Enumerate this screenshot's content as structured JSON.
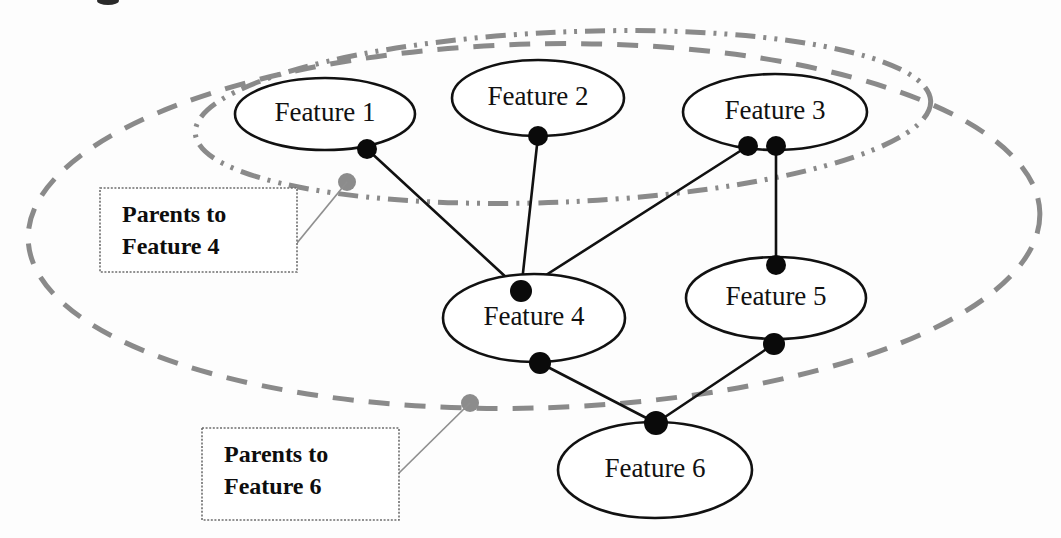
{
  "diagram": {
    "type": "node-link-graph",
    "background_color": "#fdfdfd",
    "colors": {
      "node_stroke": "#111111",
      "node_fill": "#ffffff",
      "edge": "#111111",
      "dot": "#0a0a0a",
      "dot_marker_gray": "#8c8c8c",
      "group_boundary": "#8a8a8a",
      "leader_line": "#8f8f8f",
      "callout_border": "#6e6e6e",
      "text": "#111111"
    }
  },
  "nodes": [
    {
      "id": "f1",
      "label": "Feature 1",
      "cx": 325,
      "cy": 114,
      "rx": 90,
      "ry": 36
    },
    {
      "id": "f2",
      "label": "Feature 2",
      "cx": 538,
      "cy": 98,
      "rx": 86,
      "ry": 38
    },
    {
      "id": "f3",
      "label": "Feature 3",
      "cx": 775,
      "cy": 112,
      "rx": 92,
      "ry": 38
    },
    {
      "id": "f4",
      "label": "Feature 4",
      "cx": 534,
      "cy": 318,
      "rx": 91,
      "ry": 44
    },
    {
      "id": "f5",
      "label": "Feature 5",
      "cx": 776,
      "cy": 298,
      "rx": 90,
      "ry": 41
    },
    {
      "id": "f6",
      "label": "Feature 6",
      "cx": 655,
      "cy": 470,
      "rx": 97,
      "ry": 48
    }
  ],
  "dots": [
    {
      "id": "d-f1-out",
      "on": "f1",
      "x": 367,
      "y": 149,
      "r": 10,
      "kind": "black"
    },
    {
      "id": "d-f2-out",
      "on": "f2",
      "x": 538,
      "y": 136,
      "r": 10,
      "kind": "black"
    },
    {
      "id": "d-f3-out-a",
      "on": "f3",
      "x": 748,
      "y": 146,
      "r": 10,
      "kind": "black"
    },
    {
      "id": "d-f3-out-b",
      "on": "f3",
      "x": 776,
      "y": 146,
      "r": 10,
      "kind": "black"
    },
    {
      "id": "d-f4-in",
      "on": "f4",
      "x": 521,
      "y": 291,
      "r": 11,
      "kind": "black"
    },
    {
      "id": "d-f4-out",
      "on": "f4",
      "x": 540,
      "y": 363,
      "r": 11,
      "kind": "black"
    },
    {
      "id": "d-f5-in",
      "on": "f5",
      "x": 776,
      "y": 265,
      "r": 10,
      "kind": "black"
    },
    {
      "id": "d-f5-out",
      "on": "f5",
      "x": 774,
      "y": 344,
      "r": 11,
      "kind": "black"
    },
    {
      "id": "d-f6-in",
      "on": "f6",
      "x": 656,
      "y": 423,
      "r": 12,
      "kind": "black"
    },
    {
      "id": "d-marker-parents4",
      "on": "group-parents-to-feature-4",
      "x": 347,
      "y": 182,
      "r": 9,
      "kind": "gray"
    },
    {
      "id": "d-marker-parents6",
      "on": "group-parents-to-feature-6",
      "x": 470,
      "y": 403,
      "r": 9,
      "kind": "gray"
    }
  ],
  "edges": [
    {
      "id": "e1",
      "from": "f1",
      "to": "f4",
      "x1": 367,
      "y1": 149,
      "x2": 521,
      "y2": 291
    },
    {
      "id": "e2",
      "from": "f2",
      "to": "f4",
      "x1": 538,
      "y1": 136,
      "x2": 521,
      "y2": 291
    },
    {
      "id": "e3",
      "from": "f3",
      "to": "f4",
      "x1": 748,
      "y1": 146,
      "x2": 521,
      "y2": 291
    },
    {
      "id": "e4",
      "from": "f3",
      "to": "f5",
      "x1": 776,
      "y1": 146,
      "x2": 776,
      "y2": 265
    },
    {
      "id": "e5",
      "from": "f4",
      "to": "f6",
      "x1": 540,
      "y1": 363,
      "x2": 656,
      "y2": 423
    },
    {
      "id": "e6",
      "from": "f5",
      "to": "f6",
      "x1": 774,
      "y1": 344,
      "x2": 656,
      "y2": 423
    }
  ],
  "groups": [
    {
      "id": "group-parents-to-feature-4",
      "style": "dash-dot",
      "members": [
        "f1",
        "f2",
        "f3"
      ],
      "cx": 563,
      "cy": 117,
      "rx": 368,
      "ry": 85,
      "rotate": -2.5
    },
    {
      "id": "group-parents-to-feature-6",
      "style": "dashed",
      "members": [
        "f1",
        "f2",
        "f3",
        "f4",
        "f5"
      ],
      "cx": 534,
      "cy": 226,
      "rx": 506,
      "ry": 182,
      "rotate": -1.5
    }
  ],
  "callouts": [
    {
      "id": "callout-parents-to-feature-4",
      "line1": "Parents to",
      "line2": "Feature 4",
      "box": {
        "x": 100,
        "y": 188,
        "w": 197,
        "h": 84
      },
      "leader": {
        "x1": 297,
        "y1": 243,
        "x2": 347,
        "y2": 182
      },
      "target_marker": "d-marker-parents4"
    },
    {
      "id": "callout-parents-to-feature-6",
      "line1": "Parents to",
      "line2": "Feature 6",
      "box": {
        "x": 202,
        "y": 428,
        "w": 197,
        "h": 92
      },
      "leader": {
        "x1": 399,
        "y1": 473,
        "x2": 470,
        "y2": 403
      },
      "target_marker": "d-marker-parents6"
    }
  ]
}
